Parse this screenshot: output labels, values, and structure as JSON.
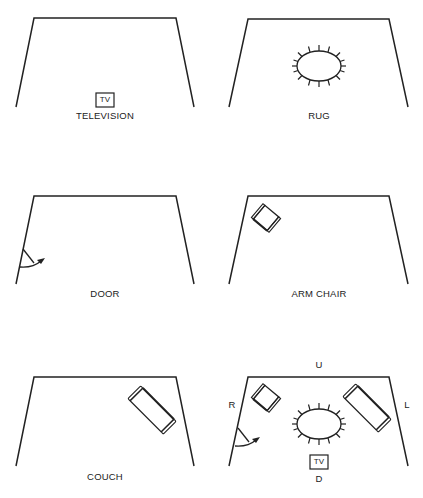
{
  "panels": [
    {
      "id": "television",
      "caption": "TELEVISION",
      "items": [
        "tv"
      ]
    },
    {
      "id": "rug",
      "caption": "RUG",
      "items": [
        "rug"
      ]
    },
    {
      "id": "door",
      "caption": "DOOR",
      "items": [
        "door"
      ]
    },
    {
      "id": "arm-chair",
      "caption": "ARM CHAIR",
      "items": [
        "arm-chair"
      ]
    },
    {
      "id": "couch",
      "caption": "COUCH",
      "items": [
        "couch"
      ]
    },
    {
      "id": "combined",
      "caption": "",
      "items": [
        "arm-chair",
        "rug",
        "couch",
        "door",
        "tv"
      ],
      "directions": {
        "up": "U",
        "down": "D",
        "left": "L",
        "right": "R"
      }
    }
  ],
  "tv_label": "TV",
  "colors": {
    "line": "#222222",
    "background": "#ffffff"
  }
}
